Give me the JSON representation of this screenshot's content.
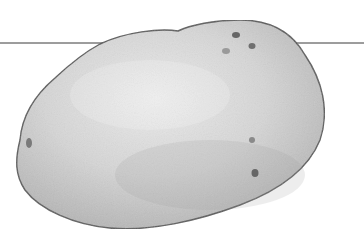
{
  "image": {
    "subject": "potato illustration",
    "style": "grayscale drawing",
    "background": "#ffffff",
    "line_color": "#333333",
    "outline_color": "#555555",
    "fill_light": "#e8e8e8",
    "fill_mid": "#cfcfcf",
    "fill_dark": "#a8a8a8",
    "eye_color": "#6a6a6a"
  }
}
